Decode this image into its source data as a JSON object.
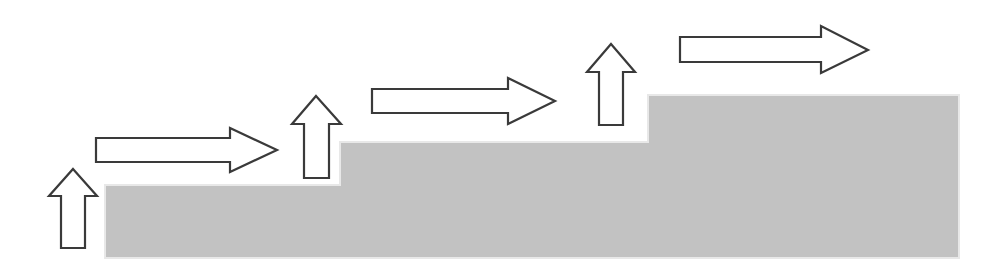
{
  "figure": {
    "name": "staircase-growth-diagram",
    "width": 1004,
    "height": 274,
    "background_color": "#ffffff"
  },
  "colors": {
    "background": "#ffffff",
    "staircase_fill": "#c2c2c2",
    "staircase_edge_highlight": "#e8e8e8",
    "arrow_stroke": "#3a3a3a",
    "arrow_fill": "#ffffff"
  },
  "staircase": {
    "name": "staircase-shape",
    "fill": "#c2c2c2",
    "steps": [
      {
        "label": "step-1",
        "x_start": 105,
        "x_end": 340,
        "top_y": 185
      },
      {
        "label": "step-2",
        "x_start": 340,
        "x_end": 648,
        "top_y": 142
      },
      {
        "label": "step-3",
        "x_start": 648,
        "x_end": 959,
        "top_y": 95
      }
    ],
    "baseline_y": 258,
    "points": "105,185 340,185 340,142 648,142 648,95 959,95 959,258 105,258"
  },
  "arrows": [
    {
      "id": "arrow-up-1",
      "name": "up-arrow-1",
      "direction": "up",
      "order": 1,
      "bbox": {
        "x": 49,
        "y": 169,
        "width": 48,
        "height": 79
      },
      "points": "73,169 97,196 85,196 85,248 61,248 61,196 49,196"
    },
    {
      "id": "arrow-right-1",
      "name": "right-arrow-1",
      "direction": "right",
      "order": 2,
      "bbox": {
        "x": 96,
        "y": 128,
        "width": 181,
        "height": 44
      },
      "points": "96,138 230,138 230,128 277,150 230,172 230,162 96,162"
    },
    {
      "id": "arrow-up-2",
      "name": "up-arrow-2",
      "direction": "up",
      "order": 3,
      "bbox": {
        "x": 292,
        "y": 96,
        "width": 49,
        "height": 82
      },
      "points": "316,96 341,124 329,124 329,178 304,178 304,124 292,124"
    },
    {
      "id": "arrow-right-2",
      "name": "right-arrow-2",
      "direction": "right",
      "order": 4,
      "bbox": {
        "x": 372,
        "y": 78,
        "width": 183,
        "height": 46
      },
      "points": "372,89 508,89 508,78 555,101 508,124 508,113 372,113"
    },
    {
      "id": "arrow-up-3",
      "name": "up-arrow-3",
      "direction": "up",
      "order": 5,
      "bbox": {
        "x": 587,
        "y": 44,
        "width": 48,
        "height": 81
      },
      "points": "611,44 635,72 623,72 623,125 599,125 599,72 587,72"
    },
    {
      "id": "arrow-right-3",
      "name": "right-arrow-3",
      "direction": "right",
      "order": 6,
      "bbox": {
        "x": 680,
        "y": 26,
        "width": 188,
        "height": 47
      },
      "points": "680,37 821,37 821,26 868,50 821,73 821,62 680,62"
    }
  ]
}
